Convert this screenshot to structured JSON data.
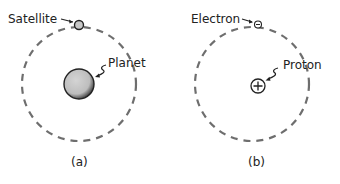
{
  "figures": [
    {
      "caption": "(a)",
      "orbit_label": "Satellite",
      "center_label": "Planet"
    },
    {
      "caption": "(b)",
      "orbit_label": "Electron",
      "center_label": "Proton"
    }
  ],
  "colors": {
    "orbit": "#6e6e6e",
    "planet_fill": "#c8c8c8",
    "satellite_fill": "#c8c8c8",
    "outline": "#222222"
  }
}
